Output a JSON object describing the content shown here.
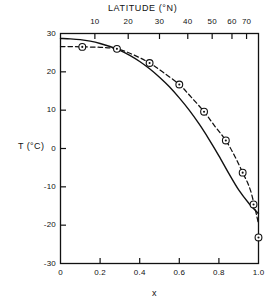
{
  "chart_data": {
    "type": "line",
    "title": "",
    "xlabel": "x",
    "ylabel": "T (°C)",
    "top_axis_label": "LATITUDE (°N)",
    "xlim": [
      0,
      1.0
    ],
    "ylim": [
      -30,
      30
    ],
    "grid": false,
    "legend": "none",
    "x_ticks": [
      "0",
      "0.2",
      "0.4",
      "0.6",
      "0.8",
      "1.0"
    ],
    "x_tick_values": [
      0,
      0.2,
      0.4,
      0.6,
      0.8,
      1.0
    ],
    "y_ticks": [
      "30",
      "20",
      "10",
      "0",
      "-10",
      "-20",
      "-30"
    ],
    "y_tick_values": [
      30,
      20,
      10,
      0,
      -10,
      -20,
      -30
    ],
    "top_ticks": [
      "10",
      "20",
      "30",
      "40",
      "50",
      "60",
      "70"
    ],
    "top_tick_values": [
      10,
      20,
      30,
      40,
      50,
      60,
      70
    ],
    "top_tick_x": [
      0.1736,
      0.342,
      0.5,
      0.6428,
      0.766,
      0.866,
      0.9397
    ],
    "series": [
      {
        "name": "model (solid curve)",
        "style": "solid",
        "marker": "none",
        "color": "#111111",
        "x": [
          0.0,
          0.05,
          0.1,
          0.15,
          0.2,
          0.25,
          0.3,
          0.35,
          0.4,
          0.45,
          0.5,
          0.55,
          0.6,
          0.65,
          0.7,
          0.75,
          0.8,
          0.85,
          0.9,
          0.95,
          1.0
        ],
        "y": [
          28.7,
          28.6,
          28.4,
          28.0,
          27.4,
          26.6,
          25.6,
          24.3,
          22.7,
          20.8,
          18.6,
          16.1,
          13.2,
          10.0,
          6.4,
          2.4,
          -1.9,
          -6.5,
          -10.8,
          -14.2,
          -17.0
        ]
      },
      {
        "name": "observed (dashed curve with markers)",
        "style": "dashed",
        "marker": "circle-dot",
        "color": "#111111",
        "x": [
          0.0,
          0.05,
          0.11,
          0.2,
          0.285,
          0.37,
          0.45,
          0.52,
          0.6,
          0.66,
          0.725,
          0.78,
          0.835,
          0.88,
          0.92,
          0.96,
          1.0
        ],
        "y": [
          26.6,
          26.6,
          26.5,
          26.4,
          26.0,
          24.4,
          22.3,
          19.8,
          16.7,
          13.4,
          9.6,
          5.8,
          2.1,
          -2.0,
          -6.3,
          -11.0,
          -19.6
        ]
      }
    ],
    "data_points": [
      {
        "x": 0.11,
        "y": 26.5
      },
      {
        "x": 0.285,
        "y": 26.0
      },
      {
        "x": 0.45,
        "y": 22.3
      },
      {
        "x": 0.6,
        "y": 16.7
      },
      {
        "x": 0.725,
        "y": 9.6
      },
      {
        "x": 0.835,
        "y": 2.1
      },
      {
        "x": 0.92,
        "y": -6.3
      },
      {
        "x": 0.975,
        "y": -14.6
      },
      {
        "x": 1.0,
        "y": -23.2
      }
    ]
  }
}
